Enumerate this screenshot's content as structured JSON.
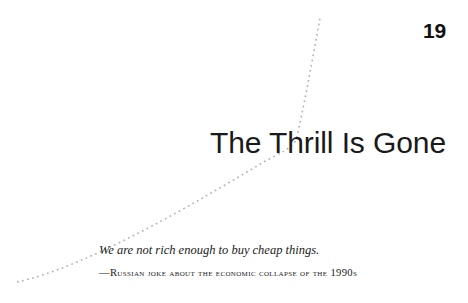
{
  "page": {
    "background_color": "#ffffff",
    "text_color": "#1a1a1a"
  },
  "chapter": {
    "number": "19",
    "title": "The Thrill Is Gone"
  },
  "epigraph": {
    "quote": "We are not rich enough to buy cheap things.",
    "attribution": "—Russian joke about the economic collapse of the 1990s"
  },
  "decoration": {
    "curve_name": "dotted-rising-curve",
    "color": "#b4b4b4",
    "style": "dotted",
    "description": "dotted line rising from lower-left, bending sharply upward at the title"
  }
}
